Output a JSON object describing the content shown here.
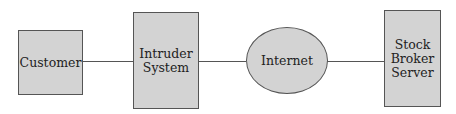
{
  "diagram": {
    "nodes": [
      {
        "id": "customer",
        "label": "Customer",
        "shape": "rectangle"
      },
      {
        "id": "intruder",
        "label": "Intruder\nSystem",
        "shape": "rectangle"
      },
      {
        "id": "internet",
        "label": "Internet",
        "shape": "ellipse"
      },
      {
        "id": "server",
        "label": "Stock\nBroker\nServer",
        "shape": "rectangle"
      }
    ],
    "edges": [
      {
        "from": "customer",
        "to": "intruder"
      },
      {
        "from": "intruder",
        "to": "internet"
      },
      {
        "from": "internet",
        "to": "server"
      }
    ],
    "colors": {
      "fill": "#d3d3d3",
      "stroke": "#555555"
    }
  }
}
